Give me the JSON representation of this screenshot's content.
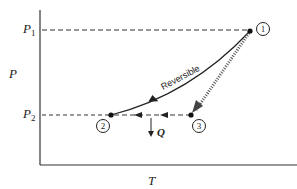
{
  "diagram": {
    "type": "P-T diagram",
    "y_axis_label": "P",
    "x_axis_label": "T",
    "levels": [
      {
        "name": "P",
        "sub": "1"
      },
      {
        "name": "P",
        "sub": "2"
      }
    ],
    "points": [
      {
        "id": "1",
        "label": "1"
      },
      {
        "id": "2",
        "label": "2"
      },
      {
        "id": "3",
        "label": "3"
      }
    ],
    "curve_label": "Reversible",
    "heat_label": "Q",
    "colors": {
      "line": "#222222",
      "background": "#ffffff"
    }
  }
}
